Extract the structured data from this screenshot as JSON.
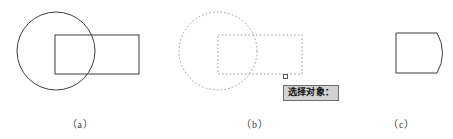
{
  "figure": {
    "background_color": "#ffffff",
    "stroke_color": "#3d3d3d",
    "dashed_stroke_color": "#9a9a9a",
    "panels": [
      {
        "id": "a",
        "caption": "（a）",
        "description": "circle overlapping rectangle, solid outlines",
        "shapes": [
          {
            "type": "circle",
            "style": "solid",
            "cx": 56,
            "cy": 51,
            "r": 39
          },
          {
            "type": "rectangle",
            "style": "solid",
            "x": 55,
            "y": 35,
            "width": 84,
            "height": 39
          }
        ]
      },
      {
        "id": "b",
        "caption": "（b）",
        "description": "same objects shown dashed to indicate selection, with pickbox cursor and prompt",
        "shapes": [
          {
            "type": "circle",
            "style": "dashed",
            "cx": 58,
            "cy": 51,
            "r": 39
          },
          {
            "type": "rectangle",
            "style": "dashed",
            "x": 58,
            "y": 35,
            "width": 84,
            "height": 39
          }
        ],
        "pickbox": {
          "name": "pickbox-cursor",
          "x": 123,
          "y": 74,
          "size": 5
        },
        "prompt": {
          "text": "选择对象：",
          "background_color": "#d2d2d2",
          "border_color": "#6e6e6e",
          "text_color": "#141414"
        }
      },
      {
        "id": "c",
        "caption": "（c）",
        "description": "resulting region: rectangle with right side replaced by circular arc",
        "shapes": [
          {
            "type": "region",
            "style": "solid",
            "x": 46,
            "y": 33,
            "width": 41,
            "height": 40,
            "arc_side": "right",
            "arc_bulge": 7
          }
        ]
      }
    ]
  }
}
